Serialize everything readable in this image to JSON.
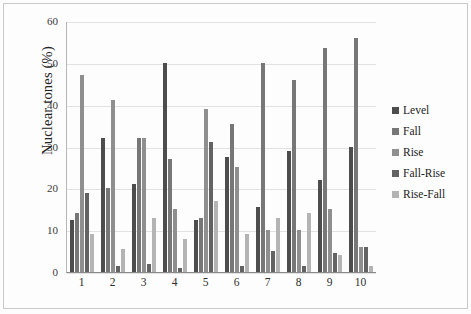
{
  "chart_data": {
    "type": "bar",
    "title": "",
    "xlabel": "",
    "ylabel": "Nuclear tones  (%)",
    "ylim": [
      0,
      60
    ],
    "ytick_step": 10,
    "yticks": [
      60,
      50,
      40,
      30,
      20,
      10,
      0
    ],
    "ytick_labels": [
      "60",
      "50",
      "40",
      "30",
      "20",
      "10",
      "0"
    ],
    "grid": true,
    "grid_axis": "y",
    "legend_position": "right",
    "categories": [
      "1",
      "2",
      "3",
      "4",
      "5",
      "6",
      "7",
      "8",
      "9",
      "10"
    ],
    "series": [
      {
        "name": "Level",
        "color": "#4d4d4d",
        "values": [
          12.5,
          32,
          21,
          50,
          12.5,
          27.5,
          15.5,
          29,
          22,
          30
        ]
      },
      {
        "name": "Fall",
        "color": "#777777",
        "values": [
          14,
          20,
          32,
          27,
          13,
          35.5,
          50,
          46,
          53.5,
          56
        ]
      },
      {
        "name": "Rise",
        "color": "#8f8f8f",
        "values": [
          47,
          41,
          32,
          15,
          39,
          25,
          10,
          10,
          15,
          6
        ]
      },
      {
        "name": "Fall-Rise",
        "color": "#636363",
        "values": [
          19,
          1.5,
          2,
          1,
          31,
          1.5,
          5,
          1.5,
          4.5,
          6
        ]
      },
      {
        "name": "Rise-Fall",
        "color": "#b4b4b4",
        "values": [
          9,
          5.5,
          13,
          8,
          17,
          9,
          13,
          14,
          4,
          1.5
        ]
      }
    ]
  },
  "legend": {
    "items": [
      {
        "label": "Level"
      },
      {
        "label": "Fall"
      },
      {
        "label": "Rise"
      },
      {
        "label": "Fall-Rise"
      },
      {
        "label": "Rise-Fall"
      }
    ]
  }
}
